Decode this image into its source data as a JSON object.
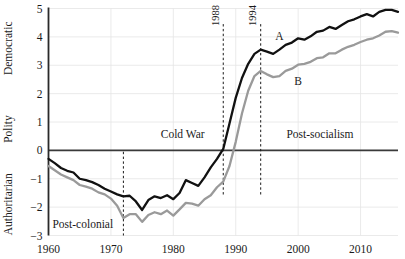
{
  "chart_data": {
    "type": "line",
    "title": "",
    "xlabel": "",
    "ylabel": "Polity",
    "ylabel_top": "Democratic",
    "ylabel_mid": "Polity",
    "ylabel_bottom": "Authoritarian",
    "xlim": [
      1960,
      2016
    ],
    "ylim": [
      -3,
      5
    ],
    "grid": true,
    "legend_position": "inline-annotation",
    "x_ticks": [
      "1960",
      "1970",
      "1980",
      "1990",
      "2000",
      "2010"
    ],
    "x_tick_values": [
      1960,
      1970,
      1980,
      1990,
      2000,
      2010
    ],
    "y_ticks": [
      "5",
      "4",
      "3",
      "2",
      "1",
      "0",
      "−1",
      "−2",
      "−3"
    ],
    "y_tick_values": [
      5,
      4,
      3,
      2,
      1,
      0,
      -1,
      -2,
      -3
    ],
    "zero_line": 0,
    "x": [
      1960,
      1961,
      1962,
      1963,
      1964,
      1965,
      1966,
      1967,
      1968,
      1969,
      1970,
      1971,
      1972,
      1973,
      1974,
      1975,
      1976,
      1977,
      1978,
      1979,
      1980,
      1981,
      1982,
      1983,
      1984,
      1985,
      1986,
      1987,
      1988,
      1989,
      1990,
      1991,
      1992,
      1993,
      1994,
      1995,
      1996,
      1997,
      1998,
      1999,
      2000,
      2001,
      2002,
      2003,
      2004,
      2005,
      2006,
      2007,
      2008,
      2009,
      2010,
      2011,
      2012,
      2013,
      2014,
      2015,
      2016
    ],
    "series": [
      {
        "name": "A",
        "color": "#111111",
        "label": "A",
        "label_x": 1997,
        "label_y": 3.9,
        "values": [
          -0.3,
          -0.45,
          -0.62,
          -0.72,
          -0.78,
          -1.0,
          -1.05,
          -1.12,
          -1.22,
          -1.35,
          -1.45,
          -1.55,
          -1.62,
          -1.6,
          -1.8,
          -2.1,
          -1.75,
          -1.62,
          -1.68,
          -1.58,
          -1.72,
          -1.5,
          -1.05,
          -1.15,
          -1.25,
          -0.95,
          -0.6,
          -0.3,
          0.05,
          0.95,
          1.85,
          2.55,
          3.05,
          3.4,
          3.55,
          3.48,
          3.4,
          3.55,
          3.72,
          3.8,
          3.95,
          3.9,
          4.02,
          4.18,
          4.22,
          4.35,
          4.28,
          4.42,
          4.55,
          4.62,
          4.72,
          4.8,
          4.72,
          4.88,
          4.95,
          4.95,
          4.88
        ]
      },
      {
        "name": "B",
        "color": "#9a9a9a",
        "label": "B",
        "label_x": 2000,
        "label_y": 2.3,
        "values": [
          -0.55,
          -0.7,
          -0.85,
          -0.95,
          -1.05,
          -1.22,
          -1.28,
          -1.35,
          -1.48,
          -1.55,
          -1.7,
          -1.95,
          -2.38,
          -2.25,
          -2.25,
          -2.52,
          -2.28,
          -2.18,
          -2.25,
          -2.12,
          -2.3,
          -2.08,
          -1.85,
          -1.88,
          -1.95,
          -1.72,
          -1.58,
          -1.3,
          -1.1,
          -0.55,
          0.3,
          1.3,
          2.1,
          2.62,
          2.8,
          2.68,
          2.58,
          2.62,
          2.8,
          2.88,
          3.02,
          3.05,
          3.12,
          3.25,
          3.28,
          3.42,
          3.42,
          3.55,
          3.65,
          3.72,
          3.82,
          3.9,
          3.95,
          4.05,
          4.18,
          4.2,
          4.15
        ]
      }
    ],
    "event_markers": [
      {
        "name": "post-colonial-divider",
        "year": 1972,
        "label": "",
        "y_top": -0.05,
        "y_bottom": -3
      },
      {
        "name": "year-1988",
        "year": 1988,
        "label": "1988",
        "y_top": 4.45,
        "y_bottom": -1.6
      },
      {
        "name": "year-1994",
        "year": 1994,
        "label": "1994",
        "y_top": 4.45,
        "y_bottom": -1.6
      }
    ],
    "era_labels": [
      {
        "name": "post-colonial",
        "text": "Post-colonial",
        "x": 1965.5,
        "y": -2.75
      },
      {
        "name": "cold-war",
        "text": "Cold War",
        "x": 1981.5,
        "y": 0.42
      },
      {
        "name": "post-socialism",
        "text": "Post-socialism",
        "x": 2003.5,
        "y": 0.42
      }
    ]
  }
}
